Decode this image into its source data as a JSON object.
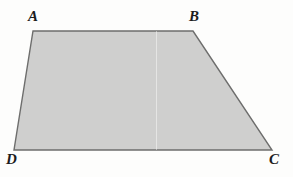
{
  "figure": {
    "type": "geometry-diagram",
    "shape_name": "trapezoid",
    "canvas": {
      "width": 293,
      "height": 177
    },
    "background_color": "#fdfdfd",
    "polygon": {
      "fill_color": "#c9c9c9",
      "stroke_color": "#5a5a5a",
      "stroke_width": 1.4,
      "vertices": [
        {
          "label": "A",
          "x": 33,
          "y": 31
        },
        {
          "label": "B",
          "x": 193,
          "y": 31
        },
        {
          "label": "C",
          "x": 272,
          "y": 150
        },
        {
          "label": "D",
          "x": 14,
          "y": 150
        }
      ]
    },
    "labels": [
      {
        "id": "A",
        "text": "A",
        "x": 28,
        "y": 9,
        "placement": "above-left-of-vertex"
      },
      {
        "id": "B",
        "text": "B",
        "x": 189,
        "y": 9,
        "placement": "above-of-vertex"
      },
      {
        "id": "C",
        "text": "C",
        "x": 269,
        "y": 152,
        "placement": "below-right-of-vertex"
      },
      {
        "id": "D",
        "text": "D",
        "x": 6,
        "y": 152,
        "placement": "below-left-of-vertex"
      }
    ],
    "artifacts": [
      {
        "id": "fold-line",
        "kind": "vertical-scan-fold",
        "x": 156,
        "y_top": 31,
        "y_bottom": 150
      }
    ]
  }
}
